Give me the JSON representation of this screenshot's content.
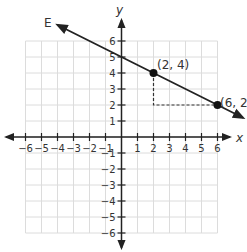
{
  "chart_data": {
    "type": "line",
    "title": "",
    "xlabel": "x",
    "ylabel": "y",
    "xlim": [
      -6,
      6
    ],
    "ylim": [
      -6,
      6
    ],
    "grid": true,
    "x_ticks": [
      "-6",
      "-5",
      "-4",
      "-3",
      "-2",
      "-1",
      "1",
      "2",
      "3",
      "4",
      "5",
      "6"
    ],
    "y_ticks": [
      "6",
      "5",
      "4",
      "3",
      "2",
      "1",
      "-1",
      "-2",
      "-3",
      "-4",
      "-5",
      "-6"
    ],
    "series": [
      {
        "name": "E",
        "equation": "y = -x/2 + 5",
        "slope": -0.5,
        "y_intercept": 5,
        "points": [
          {
            "x": 2,
            "y": 4,
            "label": "(2, 4)"
          },
          {
            "x": 6,
            "y": 2,
            "label": "(6, 2"
          }
        ]
      }
    ],
    "annotations": [
      {
        "type": "dashed-rise-run",
        "from": [
          2,
          4
        ],
        "corner": [
          2,
          2
        ],
        "to": [
          6,
          2
        ]
      }
    ],
    "colors": {
      "line": "#222222",
      "axis": "#222222",
      "grid": "#dcdcdc",
      "dashed": "#333333"
    }
  },
  "labels": {
    "line_name": "E",
    "x_axis": "x",
    "y_axis": "y",
    "point_a": "(2, 4)",
    "point_b": "(6, 2"
  }
}
